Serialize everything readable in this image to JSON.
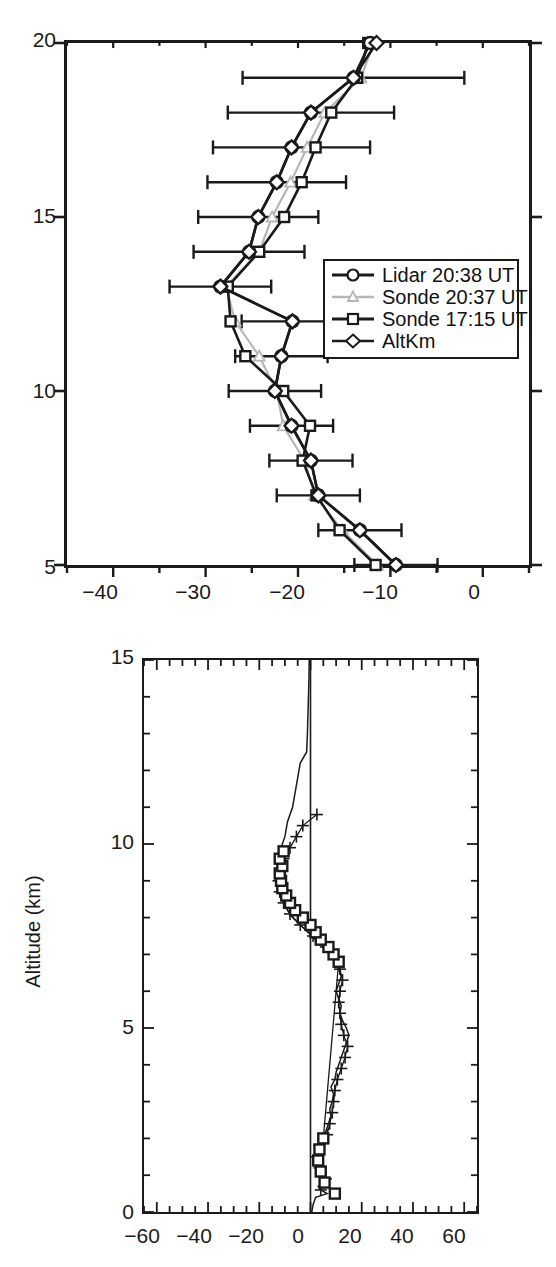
{
  "figure": {
    "background": "#ffffff",
    "ink": "#1a1a1a",
    "gray": "#b6b6b6"
  },
  "chart_data": [
    {
      "id": "upper-panel",
      "type": "line",
      "title": "",
      "subtitle": "",
      "xlabel": "",
      "ylabel": "",
      "xlim": [
        -45,
        5
      ],
      "ylim": [
        5,
        20
      ],
      "xticks": [
        -40,
        -30,
        -20,
        -10,
        0
      ],
      "xtick_labels": [
        "−40",
        "−30",
        "−20",
        "−10",
        "0"
      ],
      "xminor_step": 5,
      "yticks": [
        5,
        10,
        15,
        20
      ],
      "ytick_labels": [
        "5",
        "10",
        "15",
        "20"
      ],
      "yminor_step": 1,
      "grid": false,
      "orientation": "value-on-x, altitude-on-y",
      "legend_position": "center-right",
      "series": [
        {
          "name": "Lidar 20:38 UT",
          "marker": "circle",
          "color": "#1a1a1a",
          "y": [
            5,
            6,
            7,
            8,
            9,
            10,
            11,
            12,
            13,
            14,
            15,
            16,
            17,
            18,
            19,
            20
          ],
          "values": [
            -9.4,
            -13.3,
            -17.8,
            -18.6,
            -20.7,
            -22.5,
            -21.8,
            -20.6,
            -28.4,
            -25.3,
            -24.3,
            -22.3,
            -20.7,
            -18.6,
            -14.0,
            -12.2
          ],
          "errors": [
            4.5,
            4.5,
            4.5,
            4.5,
            4.5,
            5.0,
            5.0,
            5.5,
            5.5,
            6.0,
            6.5,
            7.5,
            8.5,
            9.0,
            12.0,
            0.0
          ]
        },
        {
          "name": "Sonde 20:37 UT",
          "marker": "triangle",
          "color": "#b6b6b6",
          "y": [
            5,
            6,
            7,
            8,
            9,
            10,
            11,
            12,
            13,
            14,
            15,
            16,
            17,
            18,
            19,
            20
          ],
          "values": [
            -11.4,
            -15.2,
            -18.2,
            -19.3,
            -21.6,
            -22.3,
            -24.2,
            -26.8,
            -27.8,
            -24.2,
            -22.8,
            -20.8,
            -19.0,
            -17.1,
            -13.2,
            -11.8
          ],
          "errors": [
            0,
            0,
            0,
            0,
            0,
            0,
            0,
            0,
            0,
            0,
            0,
            0,
            0,
            0,
            0,
            0
          ]
        },
        {
          "name": "Sonde 17:15 UT",
          "marker": "square",
          "color": "#1a1a1a",
          "y": [
            5,
            6,
            7,
            8,
            9,
            10,
            11,
            12,
            13,
            14,
            15,
            16,
            17,
            18,
            19,
            20
          ],
          "values": [
            -11.6,
            -15.5,
            -18.0,
            -19.5,
            -18.7,
            -21.6,
            -25.7,
            -27.3,
            -27.6,
            -24.2,
            -21.5,
            -19.6,
            -18.1,
            -16.4,
            -13.6,
            -12.4
          ],
          "errors": [
            0,
            0,
            0,
            0,
            0,
            0,
            0,
            0,
            0,
            0,
            0,
            0,
            0,
            0,
            0,
            0
          ]
        },
        {
          "name": "AltKm",
          "marker": "diamond",
          "color": "#1a1a1a",
          "y": [
            5,
            6,
            7,
            8,
            9,
            10,
            11,
            12,
            13,
            14,
            15,
            16,
            17,
            18,
            19,
            20
          ],
          "values": [
            -9.4,
            -13.3,
            -17.8,
            -18.6,
            -20.7,
            -22.5,
            -21.8,
            -20.6,
            -28.4,
            -25.3,
            -24.3,
            -22.3,
            -20.7,
            -18.6,
            -14.0,
            -11.5
          ],
          "errors": [
            0,
            0,
            0,
            0,
            0,
            0,
            0,
            0,
            0,
            0,
            0,
            0,
            0,
            0,
            0,
            0
          ]
        }
      ],
      "legend_entries": [
        {
          "label": "Lidar 20:38 UT",
          "marker": "circle",
          "color": "#1a1a1a"
        },
        {
          "label": "Sonde 20:37 UT",
          "marker": "triangle",
          "color": "#b6b6b6"
        },
        {
          "label": "Sonde 17:15 UT",
          "marker": "square",
          "color": "#1a1a1a"
        },
        {
          "label": "AltKm",
          "marker": "diamond",
          "color": "#1a1a1a"
        }
      ]
    },
    {
      "id": "lower-panel",
      "type": "line",
      "title": "",
      "xlabel": "",
      "ylabel": "Altitude (km)",
      "xlim": [
        -65,
        65
      ],
      "ylim": [
        0,
        15
      ],
      "xticks": [
        -60,
        -40,
        -20,
        0,
        20,
        40,
        60
      ],
      "xtick_labels": [
        "−60",
        "−40",
        "−20",
        "0",
        "20",
        "40",
        "60"
      ],
      "xminor_step": 5,
      "yticks": [
        0,
        5,
        10,
        15
      ],
      "ytick_labels": [
        "0",
        "5",
        "10",
        "15"
      ],
      "yminor_step": 1,
      "grid": false,
      "zero_reference_line": 0,
      "legend_position": "none",
      "series": [
        {
          "name": "profile-line",
          "marker": "none",
          "color": "#1a1a1a",
          "y": [
            0.0,
            0.2,
            0.4,
            0.5,
            0.6,
            0.7,
            0.8,
            0.9,
            1.0,
            1.1,
            1.2,
            1.3,
            1.4,
            1.5,
            1.6,
            1.7,
            1.8,
            1.9,
            2.0,
            2.2,
            2.4,
            2.6,
            2.8,
            3.0,
            3.2,
            3.4,
            3.6,
            3.8,
            4.0,
            4.2,
            4.4,
            4.6,
            4.8,
            5.0,
            5.2,
            5.4,
            5.6,
            5.8,
            6.0,
            6.2,
            6.4,
            6.6,
            6.8,
            7.0,
            7.2,
            7.4,
            7.6,
            7.8,
            8.0,
            8.2,
            8.4,
            8.6,
            8.8,
            9.0,
            9.2,
            9.4,
            9.6,
            9.8,
            10.0,
            10.2,
            10.4,
            10.6,
            10.8,
            11.0,
            11.2,
            11.4,
            11.6,
            11.8,
            12.0,
            12.2,
            12.5,
            13.0,
            13.5,
            14.0,
            14.5,
            15.0
          ],
          "values": [
            0.5,
            1.0,
            2.0,
            6.5,
            4.0,
            3.0,
            4.5,
            6.0,
            5.0,
            3.5,
            3.0,
            4.0,
            3.0,
            2.0,
            3.0,
            2.5,
            3.0,
            4.0,
            5.0,
            6.0,
            7.0,
            8.0,
            7.5,
            8.5,
            9.0,
            8.0,
            9.5,
            10.0,
            11.0,
            12.0,
            13.0,
            14.0,
            15.0,
            14.0,
            12.5,
            11.5,
            12.0,
            11.0,
            10.0,
            11.0,
            12.0,
            11.0,
            10.0,
            8.0,
            5.0,
            2.0,
            -1.0,
            -4.0,
            -7.0,
            -9.0,
            -10.0,
            -11.0,
            -12.0,
            -12.5,
            -13.0,
            -12.0,
            -13.0,
            -12.0,
            -11.0,
            -10.0,
            -9.5,
            -9.0,
            -8.0,
            -7.0,
            -6.5,
            -6.0,
            -5.5,
            -5.0,
            -4.5,
            -4.0,
            -1.5,
            -1.2,
            -1.0,
            -0.8,
            -0.6,
            -0.5
          ]
        },
        {
          "name": "plus-markers",
          "marker": "plus",
          "color": "#1a1a1a",
          "y": [
            0.6,
            0.9,
            1.2,
            1.5,
            1.8,
            2.1,
            2.4,
            2.7,
            3.0,
            3.3,
            3.6,
            3.9,
            4.2,
            4.5,
            4.8,
            5.1,
            5.4,
            5.7,
            6.0,
            6.3,
            6.6,
            6.9,
            7.2,
            7.5,
            7.8,
            8.1,
            8.4,
            8.7,
            9.0,
            9.3,
            9.6,
            9.9,
            10.2,
            10.5,
            10.8
          ],
          "values": [
            4.0,
            6.0,
            3.5,
            2.5,
            3.5,
            6.5,
            7.5,
            8.5,
            9.0,
            9.5,
            10.5,
            12.0,
            13.5,
            14.5,
            13.0,
            12.0,
            11.5,
            11.0,
            11.5,
            12.5,
            11.5,
            9.5,
            6.0,
            1.0,
            -4.0,
            -8.0,
            -10.5,
            -12.0,
            -12.5,
            -11.5,
            -10.5,
            -8.0,
            -5.5,
            -3.0,
            2.5
          ]
        },
        {
          "name": "square-markers",
          "marker": "square",
          "color": "#1a1a1a",
          "y": [
            0.5,
            0.8,
            1.1,
            1.4,
            1.7,
            2.0,
            6.8,
            7.0,
            7.2,
            7.4,
            7.6,
            7.8,
            8.0,
            8.2,
            8.4,
            8.6,
            8.8,
            9.0,
            9.2,
            9.4,
            9.6,
            9.8
          ],
          "values": [
            9.5,
            5.5,
            4.0,
            3.0,
            3.5,
            5.0,
            11.0,
            9.0,
            7.0,
            4.0,
            2.0,
            0.0,
            -3.0,
            -6.0,
            -8.0,
            -9.5,
            -11.0,
            -11.5,
            -12.0,
            -11.0,
            -12.0,
            -10.5
          ]
        }
      ]
    }
  ]
}
